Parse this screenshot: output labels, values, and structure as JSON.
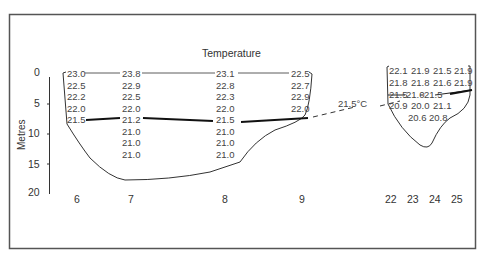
{
  "diagram": {
    "title": "Temperature",
    "y_axis": {
      "label": "Metres",
      "ticks": [
        "0",
        "5",
        "10",
        "15",
        "20"
      ]
    },
    "x_labels_left": [
      "6",
      "7",
      "8",
      "9"
    ],
    "x_labels_right": [
      "22",
      "23",
      "24",
      "25"
    ],
    "isotherm_label": "21.5°C",
    "colors": {
      "frame": "#555555",
      "line": "#222222",
      "text": "#333333"
    },
    "left_basin": {
      "columns": [
        {
          "station": "6",
          "values": [
            "23.0",
            "22.5",
            "22.2",
            "22.0",
            "21.5"
          ]
        },
        {
          "station": "7",
          "values": [
            "23.8",
            "22.9",
            "22.5",
            "22.0",
            "21.2",
            "21.0",
            "21.0",
            "21.0"
          ]
        },
        {
          "station": "8",
          "values": [
            "23.1",
            "22.8",
            "22.3",
            "22.0",
            "21.5",
            "21.0",
            "21.0",
            "21.0"
          ]
        },
        {
          "station": "9",
          "values": [
            "22.5",
            "22.7",
            "22.9",
            "22.0"
          ]
        }
      ]
    },
    "right_basin": {
      "columns": [
        {
          "station": "22",
          "values": [
            "22.1",
            "21.8",
            "21.5",
            "20.9"
          ]
        },
        {
          "station": "23",
          "values": [
            "21.9",
            "21.8",
            "21.0",
            "20.0",
            "20.6"
          ]
        },
        {
          "station": "24",
          "values": [
            "21.5",
            "21.6",
            "21.5",
            "21.1",
            "20.8"
          ]
        },
        {
          "station": "25",
          "values": [
            "21.9",
            "21.9"
          ]
        }
      ]
    }
  }
}
